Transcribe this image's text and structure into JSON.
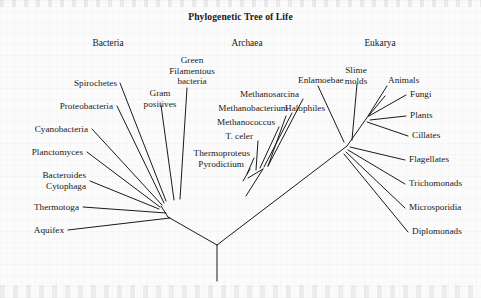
{
  "figure": {
    "title": "Phylogenetic Tree of Life",
    "type": "phylogenetic-tree",
    "ink_color": "#1a1a1a",
    "background_color": "#fbfbfb"
  },
  "domains": [
    {
      "name": "bacteria",
      "label": "Bacteria",
      "x": 108,
      "y": 44
    },
    {
      "name": "archaea",
      "label": "Archaea",
      "x": 247,
      "y": 44
    },
    {
      "name": "eukarya",
      "label": "Eukarya",
      "x": 380,
      "y": 44
    }
  ],
  "taxa": {
    "bacteria": [
      {
        "label": "Spirochetes",
        "x": 117,
        "y": 85,
        "align": "right",
        "lines": 1
      },
      {
        "label": "Gram\npositives",
        "x": 160,
        "y": 95,
        "align": "center",
        "lines": 2
      },
      {
        "label": "Green\nFilamentous\nbacteria",
        "x": 192,
        "y": 62,
        "align": "center",
        "lines": 3
      },
      {
        "label": "Proteobacteria",
        "x": 113,
        "y": 108,
        "align": "right",
        "lines": 1
      },
      {
        "label": "Cyanobacteria",
        "x": 88,
        "y": 131,
        "align": "right",
        "lines": 1
      },
      {
        "label": "Planctomyces",
        "x": 83,
        "y": 154,
        "align": "right",
        "lines": 1
      },
      {
        "label": "Bacteroides\nCytophaga",
        "x": 86,
        "y": 177,
        "align": "right",
        "lines": 2
      },
      {
        "label": "Thermotoga",
        "x": 79,
        "y": 209,
        "align": "right",
        "lines": 1
      },
      {
        "label": "Aquifex",
        "x": 64,
        "y": 232,
        "align": "right",
        "lines": 1
      }
    ],
    "archaea": [
      {
        "label": "Methanosarcina",
        "x": 299,
        "y": 96,
        "align": "right",
        "lines": 1
      },
      {
        "label": "Methanobacterium",
        "x": 288,
        "y": 110,
        "align": "right",
        "lines": 1
      },
      {
        "label": "Methanococcus",
        "x": 275,
        "y": 124,
        "align": "right",
        "lines": 1
      },
      {
        "label": "T. celer",
        "x": 253,
        "y": 138,
        "align": "right",
        "lines": 1
      },
      {
        "label": "Thermoproteus",
        "x": 250,
        "y": 155,
        "align": "right",
        "lines": 1
      },
      {
        "label": "Pyrodictium",
        "x": 244,
        "y": 166,
        "align": "right",
        "lines": 1
      },
      {
        "label": "Halophiles",
        "x": 285,
        "y": 110,
        "align": "left",
        "lines": 1
      }
    ],
    "eukarya": [
      {
        "label": "Enlamoebae",
        "x": 298,
        "y": 82,
        "align": "left",
        "lines": 1
      },
      {
        "label": "Slime\nmolds",
        "x": 356,
        "y": 72,
        "align": "center",
        "lines": 2
      },
      {
        "label": "Animals",
        "x": 388,
        "y": 82,
        "align": "left",
        "lines": 1
      },
      {
        "label": "Fungi",
        "x": 410,
        "y": 96,
        "align": "left",
        "lines": 1
      },
      {
        "label": "Plants",
        "x": 410,
        "y": 117,
        "align": "left",
        "lines": 1
      },
      {
        "label": "Cillates",
        "x": 412,
        "y": 137,
        "align": "left",
        "lines": 1
      },
      {
        "label": "Flagellates",
        "x": 409,
        "y": 161,
        "align": "left",
        "lines": 1
      },
      {
        "label": "Trichomonads",
        "x": 409,
        "y": 185,
        "align": "left",
        "lines": 1
      },
      {
        "label": "Microsporidia",
        "x": 409,
        "y": 209,
        "align": "left",
        "lines": 1
      },
      {
        "label": "Diplomonads",
        "x": 412,
        "y": 233,
        "align": "left",
        "lines": 1
      }
    ]
  },
  "tree_geometry": {
    "stroke_width": 1.0,
    "root": {
      "x": 217,
      "y": 245
    },
    "root_stem_bottom": {
      "x": 217,
      "y": 281
    },
    "nodes": {
      "bacteria_node": {
        "x": 168,
        "y": 217
      },
      "bacteria_fan": {
        "x": 161,
        "y": 206
      },
      "archaea_node": {
        "x": 246,
        "y": 196
      },
      "archaea_crown": {
        "x": 263,
        "y": 169
      },
      "crenarchaeota": {
        "x": 248,
        "y": 178
      },
      "eukarya_node": {
        "x": 347,
        "y": 146
      },
      "eukarya_crown": {
        "x": 366,
        "y": 119
      },
      "eukarya_top": {
        "x": 385,
        "y": 96
      }
    },
    "leader_lines": [
      {
        "name": "spirochetes",
        "x1": 120,
        "y1": 83,
        "x2": 166,
        "y2": 201
      },
      {
        "name": "gram-positives",
        "x1": 161,
        "y1": 105,
        "x2": 174,
        "y2": 200
      },
      {
        "name": "green-filamentous",
        "x1": 187,
        "y1": 88,
        "x2": 180,
        "y2": 199
      },
      {
        "name": "proteobacteria",
        "x1": 117,
        "y1": 106,
        "x2": 164,
        "y2": 203
      },
      {
        "name": "cyanobacteria",
        "x1": 92,
        "y1": 129,
        "x2": 162,
        "y2": 205
      },
      {
        "name": "planctomyces",
        "x1": 87,
        "y1": 152,
        "x2": 160,
        "y2": 207
      },
      {
        "name": "bacteroides",
        "x1": 90,
        "y1": 181,
        "x2": 159,
        "y2": 209
      },
      {
        "name": "thermotoga",
        "x1": 83,
        "y1": 207,
        "x2": 166,
        "y2": 213
      },
      {
        "name": "aquifex",
        "x1": 68,
        "y1": 230,
        "x2": 170,
        "y2": 218
      },
      {
        "name": "methanosarcina",
        "x1": 303,
        "y1": 99,
        "x2": 268,
        "y2": 166
      },
      {
        "name": "methanobacterium",
        "x1": 292,
        "y1": 113,
        "x2": 264,
        "y2": 167
      },
      {
        "name": "methanococcus",
        "x1": 279,
        "y1": 127,
        "x2": 260,
        "y2": 168
      },
      {
        "name": "t-celer",
        "x1": 258,
        "y1": 141,
        "x2": 256,
        "y2": 170
      },
      {
        "name": "thermoproteus",
        "x1": 254,
        "y1": 158,
        "x2": 247,
        "y2": 174
      },
      {
        "name": "pyrodictium",
        "x1": 250,
        "y1": 169,
        "x2": 243,
        "y2": 181
      },
      {
        "name": "halophiles",
        "x1": 286,
        "y1": 116,
        "x2": 268,
        "y2": 166
      },
      {
        "name": "enlamoebae",
        "x1": 318,
        "y1": 86,
        "x2": 344,
        "y2": 142
      },
      {
        "name": "slime-molds",
        "x1": 357,
        "y1": 84,
        "x2": 352,
        "y2": 140
      },
      {
        "name": "animals",
        "x1": 387,
        "y1": 86,
        "x2": 368,
        "y2": 116
      },
      {
        "name": "fungi",
        "x1": 406,
        "y1": 95,
        "x2": 369,
        "y2": 116
      },
      {
        "name": "plants",
        "x1": 406,
        "y1": 116,
        "x2": 370,
        "y2": 120
      },
      {
        "name": "cillates",
        "x1": 408,
        "y1": 136,
        "x2": 367,
        "y2": 122
      },
      {
        "name": "flagellates",
        "x1": 405,
        "y1": 160,
        "x2": 350,
        "y2": 147
      },
      {
        "name": "trichomonads",
        "x1": 405,
        "y1": 184,
        "x2": 348,
        "y2": 150
      },
      {
        "name": "microsporidia",
        "x1": 405,
        "y1": 208,
        "x2": 346,
        "y2": 152
      },
      {
        "name": "diplomonads",
        "x1": 408,
        "y1": 232,
        "x2": 344,
        "y2": 154
      }
    ]
  }
}
